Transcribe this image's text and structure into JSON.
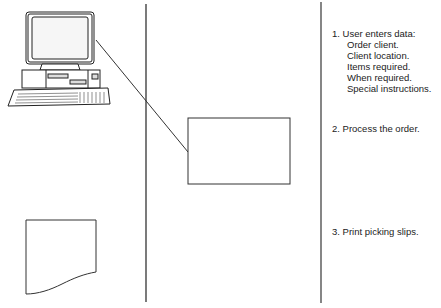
{
  "diagram": {
    "columns": [
      "symbols",
      "connectors",
      "descriptions"
    ],
    "steps": [
      {
        "number": "1.",
        "title": "1. User enters data:",
        "details": [
          "Order client.",
          "Client location.",
          "Items required.",
          "When required.",
          "Special instructions."
        ],
        "symbol": "computer-terminal"
      },
      {
        "number": "2.",
        "title": "2. Process the order.",
        "details": [],
        "symbol": "process-box"
      },
      {
        "number": "3.",
        "title": "3. Print picking slips.",
        "details": [],
        "symbol": "document"
      }
    ],
    "colors": {
      "line": "#333333",
      "background": "#ffffff"
    }
  }
}
